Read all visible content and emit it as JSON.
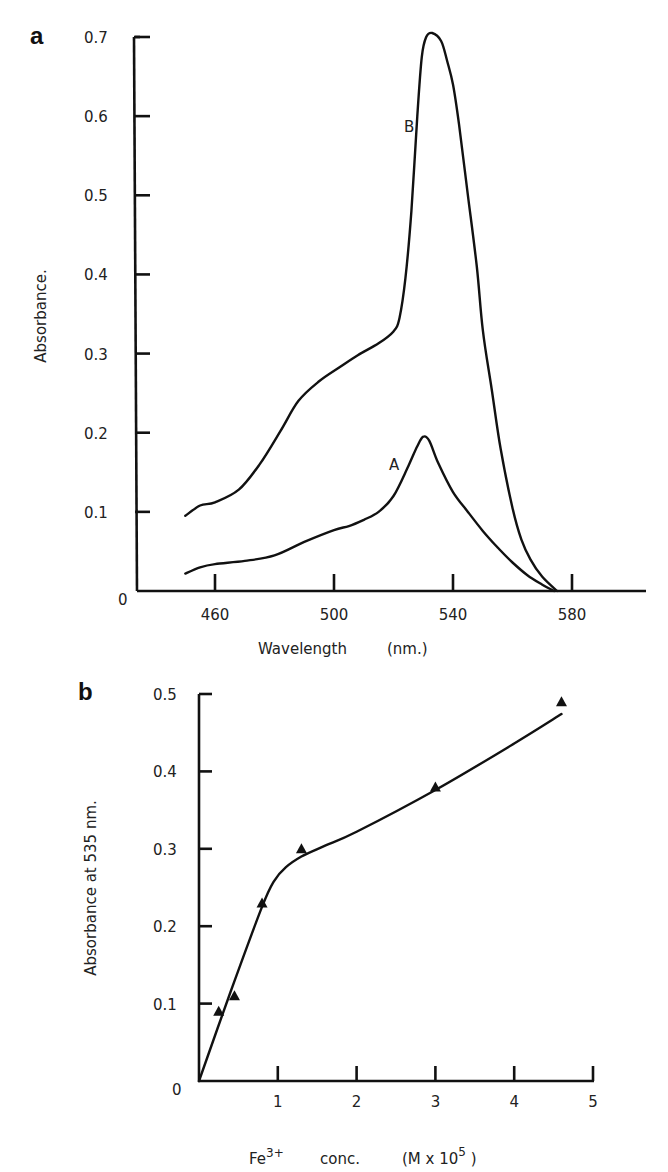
{
  "figure": {
    "panels": [
      {
        "letter": "a",
        "ylabel": "Absorbance.",
        "xlabel": "Wavelength",
        "xunit": "(nm.)",
        "curve_labels": {
          "A": "A",
          "B": "B"
        }
      },
      {
        "letter": "b",
        "ylabel": "Absorbance at 535 nm.",
        "xlabel_species": "Fe",
        "xlabel_charge": "3+",
        "xlabel_conc": "conc.",
        "xlabel_unit_prefix": "(M x 10",
        "xlabel_unit_exp": "5",
        "xlabel_unit_suffix": " )"
      }
    ]
  },
  "chart_data": [
    {
      "panel": "a",
      "type": "line",
      "title": "",
      "xlabel": "Wavelength (nm.)",
      "ylabel": "Absorbance.",
      "xlim": [
        432,
        604
      ],
      "ylim": [
        0,
        0.7
      ],
      "xticks": [
        460,
        500,
        540,
        580
      ],
      "yticks": [
        0,
        0.1,
        0.2,
        0.3,
        0.4,
        0.5,
        0.6,
        0.7
      ],
      "ytick_labels": [
        "0",
        "0.1",
        "0.2",
        "0.3",
        "0.4",
        "0.5",
        "0.6",
        "0.7"
      ],
      "grid": false,
      "legend": "inline curve labels (A, B)",
      "series": [
        {
          "name": "A",
          "x": [
            450,
            455,
            460,
            470,
            480,
            490,
            500,
            505,
            510,
            515,
            520,
            525,
            528,
            530,
            532,
            535,
            540,
            545,
            550,
            555,
            560,
            565,
            570,
            574
          ],
          "y": [
            0.022,
            0.03,
            0.034,
            0.038,
            0.045,
            0.062,
            0.077,
            0.082,
            0.09,
            0.1,
            0.12,
            0.158,
            0.183,
            0.195,
            0.19,
            0.162,
            0.125,
            0.1,
            0.076,
            0.055,
            0.036,
            0.02,
            0.008,
            0.0
          ]
        },
        {
          "name": "B",
          "x": [
            450,
            455,
            460,
            468,
            475,
            482,
            488,
            495,
            502,
            508,
            515,
            520,
            522,
            524,
            526,
            528,
            529.5,
            531,
            533,
            536,
            538,
            540,
            542,
            545,
            548,
            550,
            553,
            556,
            560,
            563,
            566,
            570,
            575
          ],
          "y": [
            0.095,
            0.108,
            0.112,
            0.128,
            0.16,
            0.202,
            0.24,
            0.265,
            0.283,
            0.298,
            0.313,
            0.328,
            0.345,
            0.395,
            0.48,
            0.6,
            0.675,
            0.7,
            0.705,
            0.695,
            0.67,
            0.64,
            0.59,
            0.5,
            0.41,
            0.33,
            0.255,
            0.18,
            0.105,
            0.065,
            0.04,
            0.018,
            0.0
          ]
        }
      ],
      "annotations": [
        {
          "text": "A",
          "x": 517,
          "y": 0.19
        },
        {
          "text": "B",
          "x": 519,
          "y": 0.62
        }
      ]
    },
    {
      "panel": "b",
      "type": "line",
      "title": "",
      "xlabel": "Fe3+ conc. (M x 10^5)",
      "ylabel": "Absorbance at 535 nm.",
      "xlim": [
        0,
        5
      ],
      "ylim": [
        0,
        0.5
      ],
      "xticks": [
        1,
        2,
        3,
        4,
        5
      ],
      "yticks": [
        0,
        0.1,
        0.2,
        0.3,
        0.4,
        0.5
      ],
      "ytick_labels": [
        "0",
        "0.1",
        "0.2",
        "0.3",
        "0.4",
        "0.5"
      ],
      "grid": false,
      "legend": "none",
      "series": [
        {
          "name": "measured",
          "marker": "triangle",
          "x": [
            0.25,
            0.45,
            0.8,
            1.3,
            3.0,
            4.6
          ],
          "y": [
            0.09,
            0.11,
            0.23,
            0.3,
            0.38,
            0.49
          ]
        },
        {
          "name": "fit",
          "marker": "none",
          "x": [
            0,
            0.4,
            0.8,
            0.95,
            1.1,
            1.3,
            1.6,
            2.0,
            3.0,
            4.0,
            4.6
          ],
          "y": [
            0,
            0.115,
            0.225,
            0.258,
            0.276,
            0.29,
            0.304,
            0.322,
            0.376,
            0.436,
            0.474
          ]
        }
      ]
    }
  ]
}
